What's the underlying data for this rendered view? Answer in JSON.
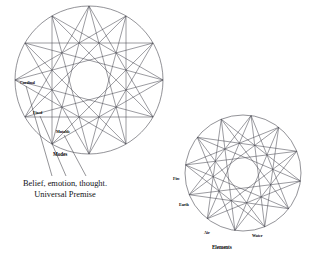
{
  "page": {
    "background_color": "#ffffff",
    "line_color": "#4a4a52",
    "text_color": "#07070a",
    "width": 322,
    "height": 262
  },
  "left_diagram": {
    "name": "Modes wheel",
    "caption": "Modes",
    "center_x": 89,
    "center_y": 80,
    "radius": 74,
    "points": 12,
    "star_skip": 5,
    "point_labels": [
      {
        "label": "Cardinal",
        "x": 20,
        "y": 81
      },
      {
        "label": "Fixed",
        "x": 33,
        "y": 111
      },
      {
        "label": "Mutable",
        "x": 56,
        "y": 130
      }
    ]
  },
  "left_annotation": {
    "lines": [
      "Belief, emotion, thought.",
      "Universal Premise"
    ]
  },
  "right_diagram": {
    "name": "Elements wheel",
    "caption": "Elements",
    "center_x": 243,
    "center_y": 173,
    "radius": 58,
    "points": 12,
    "star_skip": 5,
    "point_labels": [
      {
        "label": "Fire",
        "x": 173,
        "y": 177
      },
      {
        "label": "Earth",
        "x": 179,
        "y": 203
      },
      {
        "label": "Air",
        "x": 204,
        "y": 231
      },
      {
        "label": "Water",
        "x": 252,
        "y": 234
      }
    ]
  },
  "chart_data": {
    "type": "diagram",
    "title": "",
    "figures": [
      {
        "id": "modes",
        "shape": "circle with inscribed 12-point star polygon",
        "caption": "Modes",
        "vertices": 12,
        "star_skip": 5,
        "labeled_vertices": [
          "Cardinal",
          "Fixed",
          "Mutable"
        ],
        "annotation": [
          "Belief, emotion, thought.",
          "Universal Premise"
        ]
      },
      {
        "id": "elements",
        "shape": "circle with inscribed 12-point star polygon",
        "caption": "Elements",
        "vertices": 12,
        "star_skip": 5,
        "labeled_vertices": [
          "Fire",
          "Earth",
          "Air",
          "Water"
        ]
      }
    ]
  }
}
